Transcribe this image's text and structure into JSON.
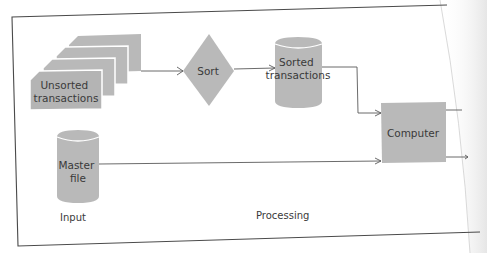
{
  "diagram": {
    "type": "batch-processing-flowchart",
    "nodes": [
      {
        "id": "unsorted",
        "shape": "stacked-documents",
        "label_lines": [
          "Unsorted",
          "transactions"
        ]
      },
      {
        "id": "sort",
        "shape": "diamond",
        "label_lines": [
          "Sort"
        ]
      },
      {
        "id": "sorted",
        "shape": "cylinder",
        "label_lines": [
          "Sorted",
          "transactions"
        ]
      },
      {
        "id": "computer",
        "shape": "rectangle",
        "label_lines": [
          "Computer"
        ]
      },
      {
        "id": "master",
        "shape": "cylinder",
        "label_lines": [
          "Master",
          "file"
        ]
      }
    ],
    "edges": [
      {
        "from": "unsorted",
        "to": "sort"
      },
      {
        "from": "sort",
        "to": "sorted"
      },
      {
        "from": "sorted",
        "to": "computer"
      },
      {
        "from": "master",
        "to": "computer"
      },
      {
        "from": "computer",
        "to": "output-1"
      },
      {
        "from": "computer",
        "to": "output-2"
      }
    ],
    "section_labels": {
      "input": "Input",
      "processing": "Processing"
    },
    "colors": {
      "shape_fill": "#b9b9b9",
      "line": "#5a5a5a",
      "text": "#3a3a3a",
      "background": "#ffffff"
    }
  }
}
